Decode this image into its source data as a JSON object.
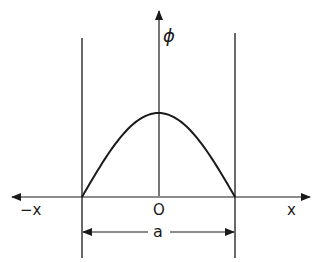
{
  "diagram": {
    "labels": {
      "y_axis": "ϕ",
      "x_pos": "x",
      "x_neg": "−x",
      "origin": "O",
      "width": "a"
    },
    "colors": {
      "ink": "#1a1a1a",
      "background": "#ffffff"
    },
    "curve": {
      "shape": "half-sine",
      "description": "ϕ(x) between walls at x = ±a/2, zero at walls, maximum at origin"
    }
  }
}
